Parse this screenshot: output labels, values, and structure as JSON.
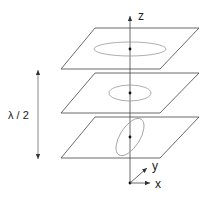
{
  "diagram": {
    "labels": {
      "z_axis": "z",
      "x_axis": "x",
      "y_axis": "y",
      "half_wavelength": "λ / 2"
    },
    "planes": [
      {
        "name": "top",
        "ellipse": "horizontal ellipse (wide)"
      },
      {
        "name": "middle",
        "ellipse": "circle-like ellipse"
      },
      {
        "name": "bottom",
        "ellipse": "tilted ellipse"
      }
    ],
    "colors": {
      "line": "#333333",
      "ellipse": "#888888",
      "background": "#ffffff"
    }
  }
}
